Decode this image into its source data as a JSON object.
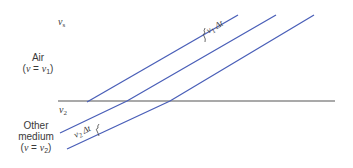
{
  "figure": {
    "labels": {
      "vs_top": {
        "base": "v",
        "sub": "s"
      },
      "air_name": "Air",
      "air_speed": {
        "prefix": "(",
        "var": "v",
        "eq": " = ",
        "base": "v",
        "sub": "1",
        "suffix": ")"
      },
      "interface": {
        "base": "v",
        "sub": "2"
      },
      "other_name_line1": "Other",
      "other_name_line2": "medium",
      "other_speed": {
        "prefix": "(",
        "var": "v",
        "eq": " = ",
        "base": "v",
        "sub": "2",
        "suffix": ")"
      },
      "spacing_upper": {
        "base": "v",
        "sub": "1",
        "delta": "Δt"
      },
      "spacing_lower": {
        "base": "v",
        "sub": "2",
        "delta": "Δt"
      }
    },
    "colors": {
      "wavefront": "#4a5fb8",
      "interface": "#555555",
      "text": "#3a3a3a"
    },
    "interface_line": {
      "x1": 58,
      "y1": 101,
      "x2": 335,
      "y2": 101
    },
    "wavefronts": [
      {
        "name": "wavefront-1",
        "points": "238,15 87,102"
      },
      {
        "name": "wavefront-2",
        "points": "276,15 127,101 60,133"
      },
      {
        "name": "wavefront-3",
        "points": "314,15 170,101 67,149"
      }
    ]
  }
}
